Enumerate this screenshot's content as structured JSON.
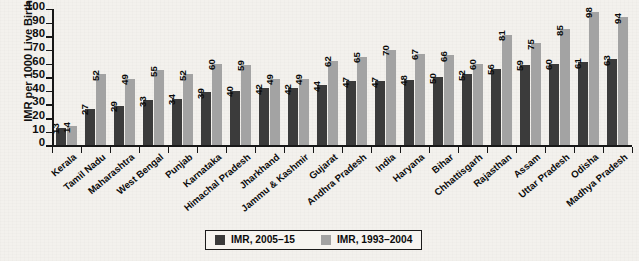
{
  "chart_data": {
    "type": "bar",
    "title": "",
    "xlabel": "",
    "ylabel": "IMR per 1000 Live Births",
    "ylim": [
      0,
      100
    ],
    "ytick_step": 10,
    "yticks": [
      0,
      10,
      20,
      30,
      40,
      50,
      60,
      70,
      80,
      90,
      100
    ],
    "grid": false,
    "legend_position": "bottom-center",
    "categories": [
      "Kerala",
      "Tamil Nadu",
      "Maharashtra",
      "West Bengal",
      "Punjab",
      "Karnataka",
      "Himachal Pradesh",
      "Jharkhand",
      "Jammu & Kashmir",
      "Gujarat",
      "Andhra Pradesh",
      "India",
      "Haryana",
      "Bihar",
      "Chhattisgarh",
      "Rajasthan",
      "Assam",
      "Uttar Pradesh",
      "Odisha",
      "Madhya Pradesh"
    ],
    "series": [
      {
        "name": "IMR, 2005–15",
        "color": "#3b3b3b",
        "values": [
          13,
          27,
          29,
          33,
          34,
          39,
          40,
          42,
          42,
          44,
          47,
          47,
          48,
          50,
          52,
          56,
          59,
          60,
          61,
          63
        ]
      },
      {
        "name": "IMR, 1993–2004",
        "color": "#a3a3a3",
        "values": [
          14,
          52,
          49,
          55,
          52,
          60,
          59,
          49,
          49,
          62,
          65,
          70,
          67,
          66,
          60,
          81,
          75,
          85,
          98,
          94
        ]
      }
    ]
  },
  "legend": {
    "items": [
      {
        "label": "IMR, 2005–15",
        "color": "#3b3b3b"
      },
      {
        "label": "IMR, 1993–2004",
        "color": "#a3a3a3"
      }
    ]
  },
  "colors": {
    "series_recent": "#3b3b3b",
    "series_older": "#a3a3a3",
    "axis": "#171717",
    "text": "#0b0b0b",
    "background": "#f3f1ed"
  }
}
